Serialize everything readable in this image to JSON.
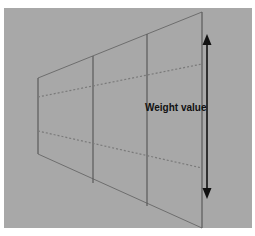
{
  "diagram": {
    "label": "Weight value",
    "colors": {
      "background": "#ffffff",
      "panel": "#a8a8a8",
      "lines": "#5a5a5a",
      "arrow": "#111111",
      "label": "#111111"
    },
    "vertical_divisions": 4,
    "dashed_guides": 2,
    "arrow": {
      "type": "double-headed",
      "orientation": "vertical"
    }
  }
}
